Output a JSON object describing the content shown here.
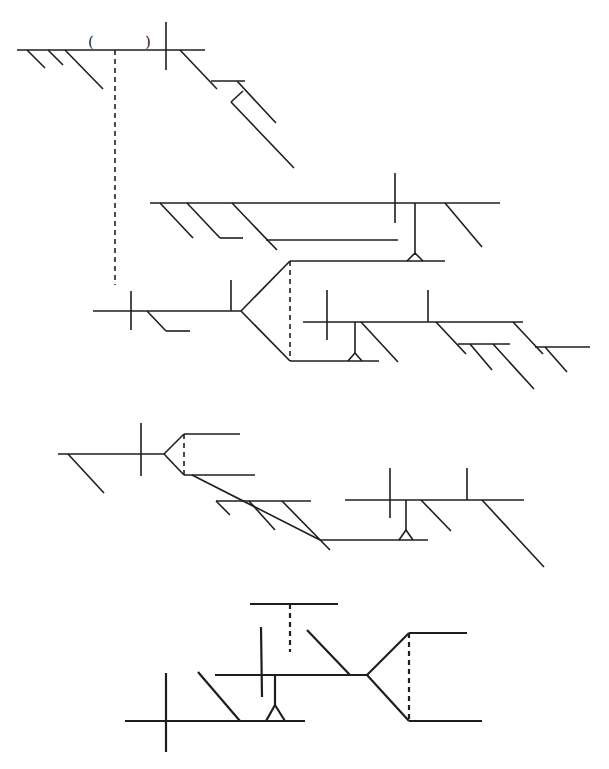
{
  "canvas": {
    "width": 609,
    "height": 769,
    "background": "#ffffff",
    "ink": "#1e1e1e"
  },
  "diagrams": [
    {
      "id": "diagram-1",
      "name": "top-left-structure",
      "segments": [
        {
          "x1": 17,
          "y1": 50,
          "x2": 205,
          "y2": 50,
          "kind": "main-line"
        },
        {
          "x1": 166,
          "y1": 22,
          "x2": 166,
          "y2": 70,
          "kind": "cross-bar"
        },
        {
          "x1": 27,
          "y1": 50,
          "x2": 45,
          "y2": 68,
          "kind": "branch"
        },
        {
          "x1": 48,
          "y1": 50,
          "x2": 63,
          "y2": 65,
          "kind": "branch"
        },
        {
          "x1": 65,
          "y1": 50,
          "x2": 103,
          "y2": 89,
          "kind": "branch"
        },
        {
          "x1": 115,
          "y1": 50,
          "x2": 115,
          "y2": 285,
          "kind": "dashed-link",
          "dashed": true
        },
        {
          "x1": 180,
          "y1": 50,
          "x2": 217,
          "y2": 89,
          "kind": "branch"
        },
        {
          "x1": 211,
          "y1": 81,
          "x2": 245,
          "y2": 81,
          "kind": "sub-line"
        },
        {
          "x1": 237,
          "y1": 81,
          "x2": 276,
          "y2": 123,
          "kind": "branch"
        },
        {
          "x1": 243,
          "y1": 91,
          "x2": 231,
          "y2": 102,
          "kind": "connector"
        },
        {
          "x1": 231,
          "y1": 102,
          "x2": 294,
          "y2": 168,
          "kind": "branch"
        }
      ],
      "glyphs": [
        {
          "x": 88,
          "y": 47,
          "text": "("
        },
        {
          "x": 145,
          "y": 47,
          "text": ")"
        }
      ],
      "triangles": []
    },
    {
      "id": "diagram-2",
      "name": "upper-right-structure",
      "segments": [
        {
          "x1": 150,
          "y1": 203,
          "x2": 500,
          "y2": 203,
          "kind": "main-line"
        },
        {
          "x1": 395,
          "y1": 173,
          "x2": 395,
          "y2": 223,
          "kind": "cross-bar"
        },
        {
          "x1": 160,
          "y1": 203,
          "x2": 193,
          "y2": 238,
          "kind": "branch"
        },
        {
          "x1": 187,
          "y1": 203,
          "x2": 220,
          "y2": 238,
          "kind": "branch"
        },
        {
          "x1": 220,
          "y1": 238,
          "x2": 243,
          "y2": 238,
          "kind": "sub-line"
        },
        {
          "x1": 232,
          "y1": 203,
          "x2": 277,
          "y2": 250,
          "kind": "branch"
        },
        {
          "x1": 266,
          "y1": 240,
          "x2": 398,
          "y2": 240,
          "kind": "sub-line"
        },
        {
          "x1": 445,
          "y1": 203,
          "x2": 482,
          "y2": 247,
          "kind": "branch"
        },
        {
          "x1": 415,
          "y1": 203,
          "x2": 415,
          "y2": 253,
          "kind": "stem"
        },
        {
          "x1": 290,
          "y1": 261,
          "x2": 445,
          "y2": 261,
          "kind": "fork-upper-line"
        },
        {
          "x1": 93,
          "y1": 311,
          "x2": 241,
          "y2": 311,
          "kind": "main-line"
        },
        {
          "x1": 131,
          "y1": 291,
          "x2": 131,
          "y2": 330,
          "kind": "cross-bar"
        },
        {
          "x1": 147,
          "y1": 311,
          "x2": 166,
          "y2": 331,
          "kind": "branch"
        },
        {
          "x1": 166,
          "y1": 331,
          "x2": 190,
          "y2": 331,
          "kind": "sub-line"
        },
        {
          "x1": 231,
          "y1": 280,
          "x2": 231,
          "y2": 311,
          "kind": "tick"
        },
        {
          "x1": 241,
          "y1": 311,
          "x2": 290,
          "y2": 261,
          "kind": "fork-upper"
        },
        {
          "x1": 241,
          "y1": 311,
          "x2": 290,
          "y2": 361,
          "kind": "fork-lower"
        },
        {
          "x1": 290,
          "y1": 261,
          "x2": 290,
          "y2": 361,
          "kind": "dashed-link",
          "dashed": true
        },
        {
          "x1": 290,
          "y1": 361,
          "x2": 379,
          "y2": 361,
          "kind": "fork-lower-line"
        },
        {
          "x1": 303,
          "y1": 322,
          "x2": 523,
          "y2": 322,
          "kind": "main-line"
        },
        {
          "x1": 327,
          "y1": 290,
          "x2": 327,
          "y2": 340,
          "kind": "cross-bar"
        },
        {
          "x1": 355,
          "y1": 322,
          "x2": 355,
          "y2": 353,
          "kind": "stem"
        },
        {
          "x1": 361,
          "y1": 322,
          "x2": 398,
          "y2": 362,
          "kind": "branch"
        },
        {
          "x1": 428,
          "y1": 290,
          "x2": 428,
          "y2": 322,
          "kind": "tick"
        },
        {
          "x1": 436,
          "y1": 322,
          "x2": 466,
          "y2": 354,
          "kind": "branch"
        },
        {
          "x1": 458,
          "y1": 344,
          "x2": 510,
          "y2": 344,
          "kind": "sub-line"
        },
        {
          "x1": 470,
          "y1": 344,
          "x2": 492,
          "y2": 370,
          "kind": "branch"
        },
        {
          "x1": 493,
          "y1": 344,
          "x2": 534,
          "y2": 389,
          "kind": "branch"
        },
        {
          "x1": 513,
          "y1": 322,
          "x2": 543,
          "y2": 354,
          "kind": "branch"
        },
        {
          "x1": 535,
          "y1": 347,
          "x2": 590,
          "y2": 347,
          "kind": "sub-line"
        },
        {
          "x1": 545,
          "y1": 347,
          "x2": 567,
          "y2": 372,
          "kind": "branch"
        }
      ],
      "glyphs": [],
      "triangles": [
        {
          "apex_x": 415,
          "apex_y": 253,
          "left_x": 407,
          "right_x": 423,
          "base_y": 261
        },
        {
          "apex_x": 355,
          "apex_y": 353,
          "left_x": 348,
          "right_x": 362,
          "base_y": 361
        }
      ]
    },
    {
      "id": "diagram-3",
      "name": "middle-structure",
      "segments": [
        {
          "x1": 58,
          "y1": 454,
          "x2": 164,
          "y2": 454,
          "kind": "main-line"
        },
        {
          "x1": 141,
          "y1": 423,
          "x2": 141,
          "y2": 476,
          "kind": "cross-bar"
        },
        {
          "x1": 68,
          "y1": 454,
          "x2": 104,
          "y2": 493,
          "kind": "branch"
        },
        {
          "x1": 164,
          "y1": 454,
          "x2": 184,
          "y2": 434,
          "kind": "fork-upper"
        },
        {
          "x1": 164,
          "y1": 454,
          "x2": 184,
          "y2": 475,
          "kind": "fork-lower"
        },
        {
          "x1": 184,
          "y1": 434,
          "x2": 240,
          "y2": 434,
          "kind": "fork-upper-line"
        },
        {
          "x1": 184,
          "y1": 475,
          "x2": 255,
          "y2": 475,
          "kind": "fork-lower-line"
        },
        {
          "x1": 184,
          "y1": 434,
          "x2": 184,
          "y2": 475,
          "kind": "dashed-link",
          "dashed": true
        },
        {
          "x1": 192,
          "y1": 475,
          "x2": 320,
          "y2": 540,
          "kind": "branch-chain"
        },
        {
          "x1": 216,
          "y1": 501,
          "x2": 311,
          "y2": 501,
          "kind": "sub-line"
        },
        {
          "x1": 216,
          "y1": 501,
          "x2": 230,
          "y2": 515,
          "kind": "branch"
        },
        {
          "x1": 249,
          "y1": 501,
          "x2": 275,
          "y2": 530,
          "kind": "branch"
        },
        {
          "x1": 282,
          "y1": 501,
          "x2": 330,
          "y2": 550,
          "kind": "branch"
        },
        {
          "x1": 320,
          "y1": 540,
          "x2": 428,
          "y2": 540,
          "kind": "sub-line"
        },
        {
          "x1": 345,
          "y1": 500,
          "x2": 524,
          "y2": 500,
          "kind": "main-line"
        },
        {
          "x1": 390,
          "y1": 468,
          "x2": 390,
          "y2": 518,
          "kind": "cross-bar"
        },
        {
          "x1": 406,
          "y1": 500,
          "x2": 406,
          "y2": 530,
          "kind": "stem"
        },
        {
          "x1": 421,
          "y1": 500,
          "x2": 451,
          "y2": 531,
          "kind": "branch"
        },
        {
          "x1": 467,
          "y1": 468,
          "x2": 467,
          "y2": 500,
          "kind": "tick"
        },
        {
          "x1": 482,
          "y1": 500,
          "x2": 544,
          "y2": 567,
          "kind": "branch"
        }
      ],
      "glyphs": [],
      "triangles": [
        {
          "apex_x": 406,
          "apex_y": 530,
          "left_x": 399,
          "right_x": 413,
          "base_y": 540
        }
      ]
    },
    {
      "id": "diagram-4",
      "name": "bottom-structure",
      "bold": true,
      "segments": [
        {
          "x1": 250,
          "y1": 604,
          "x2": 338,
          "y2": 604,
          "kind": "top-line"
        },
        {
          "x1": 290,
          "y1": 604,
          "x2": 290,
          "y2": 652,
          "kind": "dashed-link",
          "dashed": true
        },
        {
          "x1": 261,
          "y1": 627,
          "x2": 262,
          "y2": 697,
          "kind": "cross-bar"
        },
        {
          "x1": 307,
          "y1": 630,
          "x2": 350,
          "y2": 675,
          "kind": "branch"
        },
        {
          "x1": 215,
          "y1": 675,
          "x2": 367,
          "y2": 675,
          "kind": "main-line"
        },
        {
          "x1": 367,
          "y1": 675,
          "x2": 409,
          "y2": 633,
          "kind": "fork-upper"
        },
        {
          "x1": 367,
          "y1": 675,
          "x2": 409,
          "y2": 721,
          "kind": "fork-lower"
        },
        {
          "x1": 409,
          "y1": 633,
          "x2": 467,
          "y2": 633,
          "kind": "fork-upper-line"
        },
        {
          "x1": 409,
          "y1": 721,
          "x2": 482,
          "y2": 721,
          "kind": "fork-lower-line"
        },
        {
          "x1": 409,
          "y1": 633,
          "x2": 409,
          "y2": 721,
          "kind": "dashed-link",
          "dashed": true
        },
        {
          "x1": 275,
          "y1": 675,
          "x2": 275,
          "y2": 705,
          "kind": "stem"
        },
        {
          "x1": 125,
          "y1": 721,
          "x2": 305,
          "y2": 721,
          "kind": "lower-line"
        },
        {
          "x1": 166,
          "y1": 673,
          "x2": 166,
          "y2": 752,
          "kind": "cross-bar"
        },
        {
          "x1": 198,
          "y1": 672,
          "x2": 240,
          "y2": 721,
          "kind": "branch"
        }
      ],
      "glyphs": [],
      "triangles": [
        {
          "apex_x": 275,
          "apex_y": 705,
          "left_x": 266,
          "right_x": 285,
          "base_y": 721
        }
      ]
    }
  ]
}
